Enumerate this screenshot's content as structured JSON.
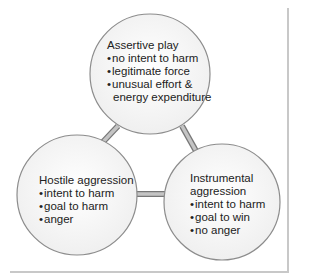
{
  "diagram": {
    "nodes": [
      {
        "id": "assertive",
        "title": "Assertive play",
        "items": [
          "no intent to harm",
          "legitimate force",
          "unusual effort &"
        ],
        "continuation": "energy expenditure"
      },
      {
        "id": "hostile",
        "title": "Hostile aggression",
        "items": [
          "intent to harm",
          "goal to harm",
          "anger"
        ]
      },
      {
        "id": "instrumental",
        "title_line1": "Instrumental",
        "title_line2": "aggression",
        "items": [
          "intent to harm",
          "goal to win",
          "no anger"
        ]
      }
    ],
    "edges": [
      [
        "assertive",
        "hostile"
      ],
      [
        "assertive",
        "instrumental"
      ],
      [
        "hostile",
        "instrumental"
      ]
    ],
    "colors": {
      "circle_fill": "#f6f6f6",
      "circle_stroke": "#8c8c8c",
      "connector": "#9a9a9a",
      "frame": "#c8c8c8"
    }
  }
}
